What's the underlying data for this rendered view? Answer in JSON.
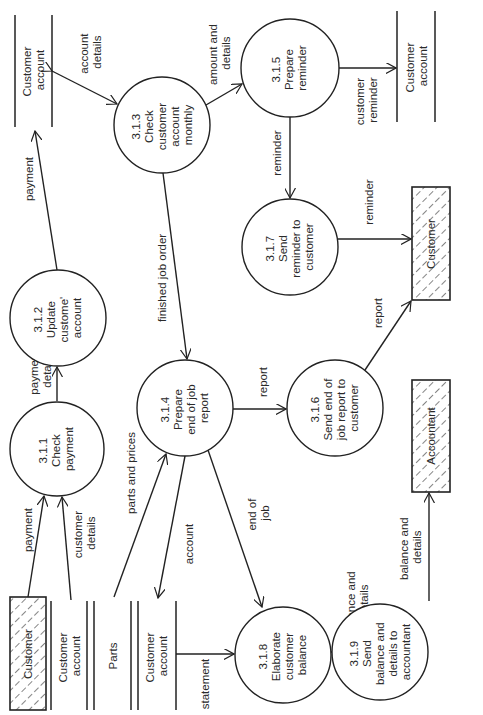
{
  "diagram": {
    "type": "data-flow-diagram",
    "orientation": "rotated 90deg counter-clockwise",
    "processes": [
      {
        "id": "3.1.1",
        "lines": [
          "3.1.1",
          "Check",
          "payment"
        ]
      },
      {
        "id": "3.1.2",
        "lines": [
          "3.1.2",
          "Update",
          "custome'",
          "account"
        ]
      },
      {
        "id": "3.1.3",
        "lines": [
          "3.1.3",
          "Check",
          "customer",
          "account",
          "monthly"
        ]
      },
      {
        "id": "3.1.4",
        "lines": [
          "3.1.4",
          "Prepare",
          "end of job",
          "report"
        ]
      },
      {
        "id": "3.1.5",
        "lines": [
          "3.1.5",
          "Prepare",
          "reminder"
        ]
      },
      {
        "id": "3.1.6",
        "lines": [
          "3.1.6",
          "Send end of",
          "job report to",
          "customer"
        ]
      },
      {
        "id": "3.1.7",
        "lines": [
          "3.1.7",
          "Send",
          "reminder to",
          "customer"
        ]
      },
      {
        "id": "3.1.8",
        "lines": [
          "3.1.8",
          "Elaborate",
          "customer",
          "balance"
        ]
      },
      {
        "id": "3.1.9",
        "lines": [
          "3.1.9",
          "Send",
          "balance and",
          "details to",
          "accountant"
        ]
      }
    ],
    "entities": [
      {
        "id": "customer-bottom",
        "label": "Customer"
      },
      {
        "id": "customer-right",
        "label": "Customer"
      },
      {
        "id": "accountant",
        "label": "Accountant"
      }
    ],
    "stores": [
      {
        "id": "store-top-left",
        "lines": [
          "Customer",
          "account"
        ]
      },
      {
        "id": "store-top-right",
        "lines": [
          "Customer",
          "account"
        ]
      },
      {
        "id": "store-bottom-1",
        "lines": [
          "Customer",
          "account"
        ]
      },
      {
        "id": "store-parts",
        "lines": [
          "Parts"
        ]
      },
      {
        "id": "store-bottom-2",
        "lines": [
          "Customer",
          "account"
        ]
      }
    ],
    "flows": [
      {
        "id": "f-payment-1",
        "lines": [
          "payment"
        ]
      },
      {
        "id": "f-customer-details",
        "lines": [
          "customer",
          "details"
        ]
      },
      {
        "id": "f-payment-details",
        "lines": [
          "payment",
          "details"
        ]
      },
      {
        "id": "f-payment-2",
        "lines": [
          "payment"
        ]
      },
      {
        "id": "f-account-details",
        "lines": [
          "account",
          "details"
        ]
      },
      {
        "id": "f-amount-details",
        "lines": [
          "amount and",
          "details"
        ]
      },
      {
        "id": "f-customer-reminder",
        "lines": [
          "customer",
          "reminder"
        ]
      },
      {
        "id": "f-reminder-1",
        "lines": [
          "reminder"
        ]
      },
      {
        "id": "f-reminder-2",
        "lines": [
          "reminder"
        ]
      },
      {
        "id": "f-finished-job-order",
        "lines": [
          "finished job order"
        ]
      },
      {
        "id": "f-parts-prices",
        "lines": [
          "parts and prices"
        ]
      },
      {
        "id": "f-report-1",
        "lines": [
          "report"
        ]
      },
      {
        "id": "f-report-2",
        "lines": [
          "report"
        ]
      },
      {
        "id": "f-account",
        "lines": [
          "account"
        ]
      },
      {
        "id": "f-end-of-job",
        "lines": [
          "end of",
          "job"
        ]
      },
      {
        "id": "f-statement",
        "lines": [
          "statement"
        ]
      },
      {
        "id": "f-balance-details-1",
        "lines": [
          "balance and",
          "details"
        ]
      },
      {
        "id": "f-balance-details-2",
        "lines": [
          "balance and",
          "details"
        ]
      }
    ]
  }
}
